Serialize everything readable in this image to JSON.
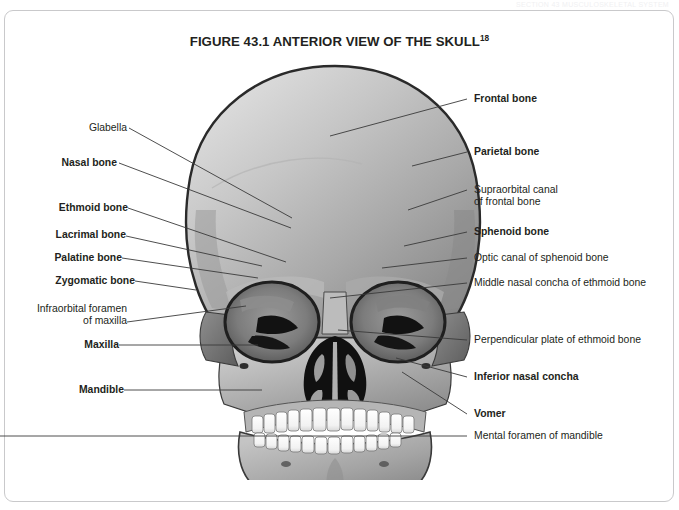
{
  "page_header": "SECTION 43 MUSCULOSKELETAL SYSTEM",
  "figure": {
    "title": "FIGURE 43.1 ANTERIOR VIEW OF THE SKULL",
    "title_superscript": "18"
  },
  "labels_left": [
    {
      "text": "Glabella",
      "bold": false
    },
    {
      "text": "Nasal bone",
      "bold": true
    },
    {
      "text": "Ethmoid bone",
      "bold": true
    },
    {
      "text": "Lacrimal bone",
      "bold": true
    },
    {
      "text": "Palatine bone",
      "bold": true
    },
    {
      "text": "Zygomatic bone",
      "bold": true
    },
    {
      "text": "Infraorbital foramen\nof maxilla",
      "bold": false
    },
    {
      "text": "Maxilla",
      "bold": true
    },
    {
      "text": "Mandible",
      "bold": true
    }
  ],
  "labels_right": [
    {
      "text": "Frontal bone",
      "bold": true
    },
    {
      "text": "Parietal bone",
      "bold": true
    },
    {
      "text": "Supraorbital canal\nof frontal bone",
      "bold": false
    },
    {
      "text": "Sphenoid bone",
      "bold": true
    },
    {
      "text": "Optic canal of sphenoid bone",
      "bold": false
    },
    {
      "text": "Middle nasal concha of ethmoid bone",
      "bold": false
    },
    {
      "text": "Perpendicular plate of ethmoid bone",
      "bold": false
    },
    {
      "text": "Inferior nasal concha",
      "bold": true
    },
    {
      "text": "Vomer",
      "bold": true
    },
    {
      "text": "Mental foramen of mandible",
      "bold": false
    }
  ],
  "colors": {
    "frame_border": "#c9c9cb",
    "text": "#231f20",
    "leader_line": "#3a3a3a",
    "bone_light": "#d4d4d4",
    "bone_mid": "#a9a9a9",
    "bone_dark": "#6e6e6e",
    "cavity": "#141414",
    "tooth": "#fdfdfd",
    "outline": "#2a2a2a"
  }
}
